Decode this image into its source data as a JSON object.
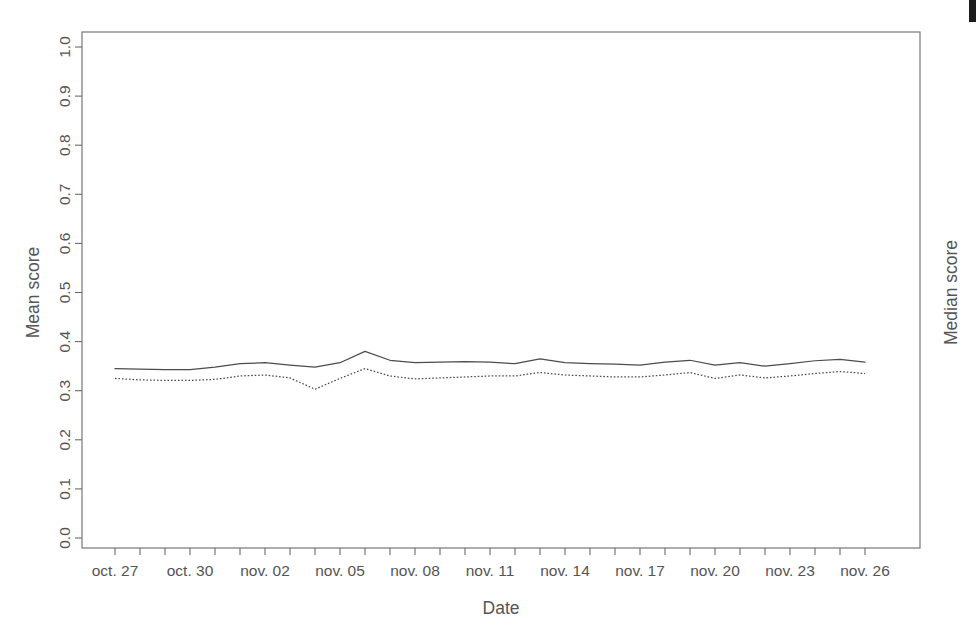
{
  "chart_data": {
    "type": "line",
    "title": "",
    "subtitle": "",
    "xlabel": "Date",
    "ylabel": "Mean score",
    "ylabel_right": "Median score",
    "grid": false,
    "legend": "none",
    "ylim": [
      0.0,
      1.0
    ],
    "ytick_labels": [
      "0.0",
      "0.1",
      "0.2",
      "0.3",
      "0.4",
      "0.5",
      "0.6",
      "0.7",
      "0.8",
      "0.9",
      "1.0"
    ],
    "ytick_values": [
      0.0,
      0.1,
      0.2,
      0.3,
      0.4,
      0.5,
      0.6,
      0.7,
      0.8,
      0.9,
      1.0
    ],
    "xtick_labels": [
      "oct. 27",
      "oct. 30",
      "nov. 02",
      "nov. 05",
      "nov. 08",
      "nov. 11",
      "nov. 14",
      "nov. 17",
      "nov. 20",
      "nov. 23",
      "nov. 26"
    ],
    "xtick_label_interval_days": 3,
    "x": [
      "oct. 27",
      "oct. 28",
      "oct. 29",
      "oct. 30",
      "oct. 31",
      "nov. 01",
      "nov. 02",
      "nov. 03",
      "nov. 04",
      "nov. 05",
      "nov. 06",
      "nov. 07",
      "nov. 08",
      "nov. 09",
      "nov. 10",
      "nov. 11",
      "nov. 12",
      "nov. 13",
      "nov. 14",
      "nov. 15",
      "nov. 16",
      "nov. 17",
      "nov. 18",
      "nov. 19",
      "nov. 20",
      "nov. 21",
      "nov. 22",
      "nov. 23",
      "nov. 24",
      "nov. 25",
      "nov. 26"
    ],
    "series": [
      {
        "name": "Mean score",
        "style": "solid",
        "color": "#4c4c4c",
        "values": [
          0.345,
          0.344,
          0.343,
          0.343,
          0.348,
          0.355,
          0.357,
          0.352,
          0.348,
          0.357,
          0.38,
          0.362,
          0.357,
          0.358,
          0.359,
          0.358,
          0.355,
          0.365,
          0.357,
          0.355,
          0.354,
          0.352,
          0.358,
          0.362,
          0.352,
          0.357,
          0.35,
          0.355,
          0.361,
          0.364,
          0.358
        ]
      },
      {
        "name": "Median score",
        "style": "dotted",
        "color": "#4c4c4c",
        "values": [
          0.325,
          0.322,
          0.321,
          0.321,
          0.323,
          0.33,
          0.332,
          0.326,
          0.303,
          0.325,
          0.345,
          0.33,
          0.324,
          0.326,
          0.328,
          0.33,
          0.33,
          0.337,
          0.332,
          0.33,
          0.328,
          0.328,
          0.332,
          0.337,
          0.325,
          0.332,
          0.326,
          0.33,
          0.335,
          0.339,
          0.335
        ]
      }
    ]
  },
  "figure": {
    "plot_area": {
      "left": 82,
      "top": 32,
      "right": 920,
      "bottom": 548
    },
    "background_color": "#ffffff",
    "axis_color": "#6b6b6b",
    "text_color": "#555555"
  },
  "artifacts": {
    "top_right_mark": "scan-artifact"
  }
}
